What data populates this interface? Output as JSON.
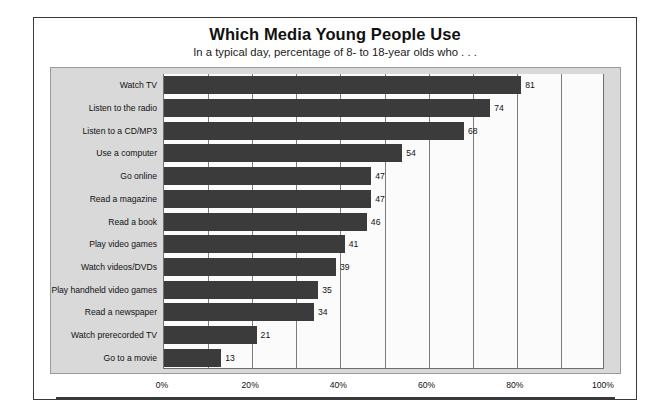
{
  "chart_data": {
    "type": "bar",
    "orientation": "horizontal",
    "title": "Which Media Young People Use",
    "subtitle": "In a typical day, percentage of 8- to 18-year olds who . . .",
    "xlabel": "",
    "ylabel": "",
    "xlim": [
      0,
      100
    ],
    "xticks": [
      "0%",
      "20%",
      "40%",
      "60%",
      "80%",
      "100%"
    ],
    "xtick_values": [
      0,
      20,
      40,
      60,
      80,
      100
    ],
    "gridline_interval": 10,
    "grid": true,
    "legend": false,
    "bar_color": "#3b3b3b",
    "panel_color": "#d9d9d9",
    "plot_bg_color": "#fbfbfb",
    "categories": [
      "Watch TV",
      "Listen to the radio",
      "Listen to a CD/MP3",
      "Use a computer",
      "Go online",
      "Read a magazine",
      "Read a book",
      "Play video games",
      "Watch videos/DVDs",
      "Play handheld video games",
      "Read a newspaper",
      "Watch prerecorded TV",
      "Go to a movie"
    ],
    "values": [
      81,
      74,
      68,
      54,
      47,
      47,
      46,
      41,
      39,
      35,
      34,
      21,
      13
    ],
    "value_labels": [
      "81",
      "74",
      "68",
      "54",
      "47",
      "47",
      "46",
      "41",
      "39",
      "35",
      "34",
      "21",
      "13"
    ]
  }
}
